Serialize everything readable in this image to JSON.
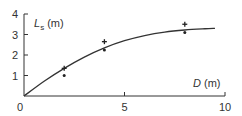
{
  "chart_data": {
    "type": "scatter",
    "title": "",
    "xlabel": "D (m)",
    "ylabel": "L_s (m)",
    "ylabel_main": "L",
    "ylabel_sub": "s",
    "ylabel_unit": " (m)",
    "xlabel_main": "D",
    "xlabel_unit": " (m)",
    "xlim": [
      0,
      10
    ],
    "ylim": [
      0,
      4
    ],
    "x_ticks": [
      0,
      5,
      10
    ],
    "y_ticks": [
      1,
      2,
      3,
      4
    ],
    "x_tick_labels": [
      "0",
      "5",
      "10"
    ],
    "y_tick_labels": [
      "1",
      "2",
      "3",
      "4"
    ],
    "origin_label": "0",
    "grid": false,
    "legend": null,
    "series": [
      {
        "name": "plus markers",
        "marker": "plus",
        "x": [
          2,
          4,
          8
        ],
        "y": [
          1.35,
          2.65,
          3.5
        ]
      },
      {
        "name": "dot markers",
        "marker": "dot",
        "x": [
          2,
          4,
          8
        ],
        "y": [
          1.0,
          2.25,
          3.1
        ]
      },
      {
        "name": "fitted curve",
        "marker": "line",
        "x": [
          0,
          1,
          2,
          3,
          4,
          5,
          6,
          7,
          8,
          9,
          9.5
        ],
        "y": [
          0,
          0.72,
          1.35,
          1.9,
          2.35,
          2.7,
          2.95,
          3.12,
          3.22,
          3.28,
          3.3
        ]
      }
    ]
  }
}
